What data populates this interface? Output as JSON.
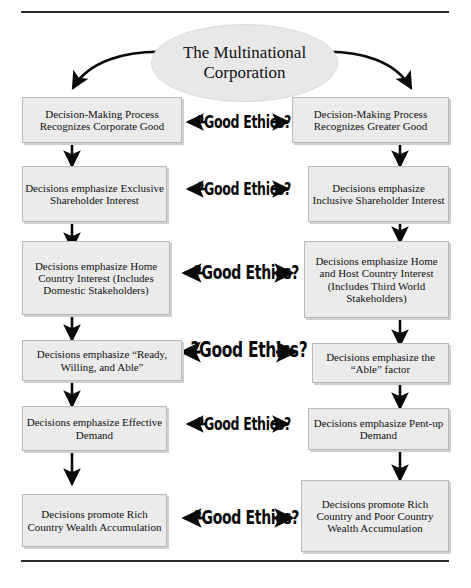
{
  "diagram": {
    "title_node": {
      "label": "The Multinational Corporation"
    },
    "ethics_label": "?Good Ethics?",
    "rules": {
      "top": "horizontal-rule",
      "bottom": "horizontal-rule"
    },
    "columns": {
      "left": "Corporate Good path",
      "right": "Greater Good path"
    },
    "rows": [
      {
        "id": "row-1",
        "left": "Decision-Making Process Recognizes Corporate Good",
        "center": "?Good Ethics?",
        "right": "Decision-Making Process Recognizes Greater Good"
      },
      {
        "id": "row-2",
        "left": "Decisions emphasize Exclusive Shareholder Interest",
        "center": "?Good Ethics?",
        "right": "Decisions emphasize Inclusive Shareholder Interest"
      },
      {
        "id": "row-3",
        "left": "Decisions emphasize Home Country Interest (Includes Domestic Stakeholders)",
        "center": "?Good Ethics?",
        "right": "Decisions emphasize Home and Host Country Interest (Includes Third World Stakeholders)"
      },
      {
        "id": "row-4",
        "left": "Decisions emphasize “Ready, Willing, and Able”",
        "center": "?Good Ethics?",
        "right": "Decisions emphasize the “Able” factor"
      },
      {
        "id": "row-5",
        "left": "Decisions emphasize Effective Demand",
        "center": "?Good Ethics?",
        "right": "Decisions emphasize Pent-up Demand"
      },
      {
        "id": "row-6",
        "left": "Decisions promote Rich Country Wealth Accumulation",
        "center": "?Good Ethics?",
        "right": "Decisions promote Rich Country and Poor Country Wealth Accumulation"
      }
    ],
    "colors": {
      "node_fill": "#ebebeb",
      "node_border": "#b9b9b9",
      "node_shadow": "#cfcfcf",
      "ellipse_fill": "#e8e8e8",
      "ink": "#111111",
      "rule": "#2b2b2b"
    }
  }
}
